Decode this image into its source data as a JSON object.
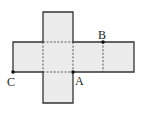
{
  "figure": {
    "type": "cube-net",
    "fill_color": "#ececec",
    "edge_color": "#333333",
    "fold_line_color": "#444444",
    "points": [
      {
        "label": "A",
        "x": 73,
        "y": 72
      },
      {
        "label": "B",
        "x": 103,
        "y": 42
      },
      {
        "label": "C",
        "x": 13,
        "y": 72
      }
    ]
  },
  "labels": {
    "a": "A",
    "b": "B",
    "c": "C"
  }
}
